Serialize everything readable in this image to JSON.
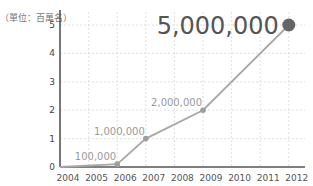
{
  "chart_data": {
    "type": "line",
    "title": "",
    "unit_label": "（單位：百萬名）",
    "xlabel": "",
    "ylabel": "",
    "ylim": [
      0,
      5
    ],
    "yticks": [
      "0",
      "1",
      "2",
      "3",
      "4",
      "5"
    ],
    "xticks": [
      "2004",
      "2005",
      "2006",
      "2007",
      "2008",
      "2009",
      "2010",
      "2011",
      "2012"
    ],
    "grid": true,
    "series": [
      {
        "name": "users",
        "points": [
          {
            "x": 2004.0,
            "y": 0,
            "label": ""
          },
          {
            "x": 2006.0,
            "y": 0.1,
            "label": "100,000"
          },
          {
            "x": 2007.0,
            "y": 1,
            "label": "1,000,000"
          },
          {
            "x": 2009.0,
            "y": 2,
            "label": "2,000,000"
          },
          {
            "x": 2012.0,
            "y": 5,
            "label": "5,000,000"
          }
        ]
      }
    ],
    "colors": {
      "line": "#a8a8a8",
      "point": "#9e9e9e",
      "highlight_point": "#666666",
      "axis": "#555555",
      "grid": "#d8d8d8",
      "highlight_label": "#555555"
    }
  }
}
